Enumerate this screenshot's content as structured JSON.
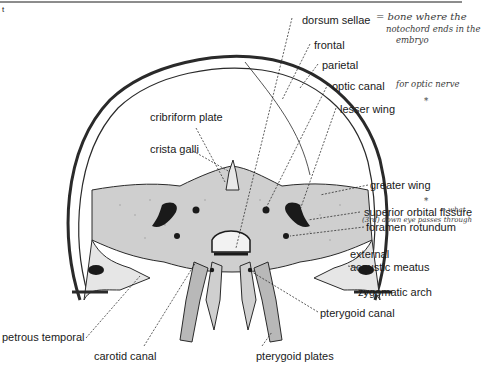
{
  "figure": {
    "colors": {
      "ink": "#1a1a1a",
      "bone_fill": "#cfcfcf",
      "skull_outline": "#2a2a2a",
      "handwriting": "#3a3a3a"
    }
  },
  "labels": {
    "dorsum_sellae": "dorsum sellae",
    "frontal": "frontal",
    "parietal": "parietal",
    "optic_canal": "optic canal",
    "lesser_wing": "lesser wing",
    "cribriform_plate": "cribriform plate",
    "crista_galli": "crista galli",
    "greater_wing": "greater wing",
    "superior_orbital_fissure": "superior orbital fissure",
    "foramen_rotundum": "foramen rotundum",
    "external_acoustic_meatus_line1": "external",
    "external_acoustic_meatus_line2": "acoustic meatus",
    "zygomatic_arch": "zygomatic arch",
    "pterygoid_canal": "pterygoid canal",
    "petrous_temporal": "petrous temporal",
    "carotid_canal": "carotid canal",
    "pterygoid_plates": "pterygoid plates"
  },
  "annotations": {
    "dorsum_note_line1": "= bone where the",
    "dorsum_note_line2": "notochord ends in the",
    "dorsum_note_line3": "embryo",
    "optic_note": "for optic nerve",
    "fissure_note_line1": "→ what",
    "fissure_note_line2": "(3rd) down eye passes through",
    "asterisk_1": "*",
    "asterisk_2": "*"
  }
}
